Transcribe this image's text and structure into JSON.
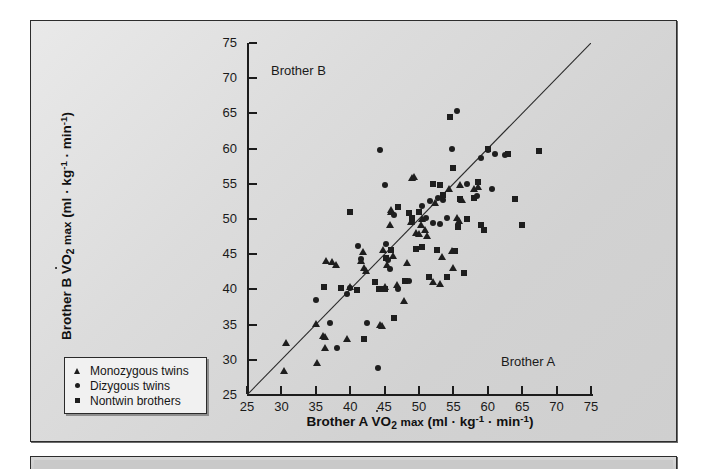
{
  "figure": {
    "annotation_brother_b": "Brother B",
    "annotation_brother_a": "Brother A"
  },
  "legend": {
    "items": [
      {
        "marker": "triangle-marker",
        "label": "Monozygous twins"
      },
      {
        "marker": "circle-marker",
        "label": "Dizygous twins"
      },
      {
        "marker": "square-marker",
        "label": "Nontwin brothers"
      }
    ]
  },
  "chart_data": {
    "type": "scatter",
    "title": "",
    "xlabel": "Brother A VO2 max (ml · kg-1 · min-1)",
    "ylabel": "Brother B VO2 max (ml · kg-1 · min-1)",
    "xlim": [
      25,
      75
    ],
    "ylim": [
      25,
      75
    ],
    "xticks": [
      25,
      30,
      35,
      40,
      45,
      50,
      55,
      60,
      65,
      70,
      75
    ],
    "yticks": [
      25,
      30,
      35,
      40,
      45,
      50,
      55,
      60,
      65,
      70,
      75
    ],
    "grid": false,
    "legend_position": "lower-left-outside",
    "reference_line": {
      "label": "line of identity",
      "from": [
        25,
        25
      ],
      "to": [
        75,
        75
      ]
    },
    "series": [
      {
        "name": "Monozygous twins",
        "marker": "triangle",
        "points": [
          [
            30.4,
            28.4
          ],
          [
            30.6,
            32.4
          ],
          [
            35.0,
            35.1
          ],
          [
            35.2,
            29.5
          ],
          [
            36.0,
            33.4
          ],
          [
            36.3,
            33.3
          ],
          [
            36.4,
            31.7
          ],
          [
            36.5,
            44.0
          ],
          [
            37.3,
            43.9
          ],
          [
            38.0,
            43.4
          ],
          [
            39.5,
            32.9
          ],
          [
            40.0,
            40.3
          ],
          [
            41.6,
            44.0
          ],
          [
            41.9,
            45.3
          ],
          [
            42.0,
            43.0
          ],
          [
            42.3,
            42.6
          ],
          [
            44.3,
            34.9
          ],
          [
            44.6,
            34.8
          ],
          [
            44.8,
            45.6
          ],
          [
            45.0,
            40.4
          ],
          [
            45.3,
            43.5
          ],
          [
            45.8,
            49.2
          ],
          [
            45.9,
            51.0
          ],
          [
            46.0,
            51.3
          ],
          [
            46.2,
            44.7
          ],
          [
            46.8,
            40.6
          ],
          [
            47.8,
            38.4
          ],
          [
            48.3,
            43.7
          ],
          [
            48.8,
            49.6
          ],
          [
            49.0,
            55.8
          ],
          [
            49.3,
            56.0
          ],
          [
            49.6,
            48.0
          ],
          [
            50.0,
            47.8
          ],
          [
            50.3,
            49.2
          ],
          [
            50.5,
            50.0
          ],
          [
            50.8,
            48.4
          ],
          [
            51.2,
            47.6
          ],
          [
            52.0,
            41.0
          ],
          [
            52.3,
            52.3
          ],
          [
            53.0,
            40.8
          ],
          [
            53.4,
            44.6
          ],
          [
            54.4,
            54.2
          ],
          [
            54.8,
            45.4
          ],
          [
            55.0,
            43.0
          ],
          [
            55.5,
            50.1
          ],
          [
            55.8,
            49.7
          ],
          [
            56.0,
            54.8
          ],
          [
            56.3,
            52.7
          ],
          [
            58.0,
            54.3
          ],
          [
            58.6,
            54.6
          ]
        ]
      },
      {
        "name": "Dizygous twins",
        "marker": "circle",
        "points": [
          [
            35.0,
            38.5
          ],
          [
            37.0,
            35.2
          ],
          [
            38.1,
            31.7
          ],
          [
            39.6,
            39.4
          ],
          [
            40.0,
            40.2
          ],
          [
            41.2,
            46.2
          ],
          [
            41.6,
            44.3
          ],
          [
            42.5,
            35.2
          ],
          [
            44.0,
            28.8
          ],
          [
            44.4,
            59.8
          ],
          [
            45.0,
            54.8
          ],
          [
            45.2,
            46.5
          ],
          [
            45.5,
            44.2
          ],
          [
            45.8,
            42.9
          ],
          [
            46.3,
            50.6
          ],
          [
            47.0,
            40.0
          ],
          [
            48.5,
            41.2
          ],
          [
            49.0,
            49.6
          ],
          [
            50.5,
            51.8
          ],
          [
            51.0,
            50.1
          ],
          [
            51.6,
            52.5
          ],
          [
            52.0,
            49.5
          ],
          [
            52.8,
            53.0
          ],
          [
            53.0,
            49.3
          ],
          [
            53.5,
            52.7
          ],
          [
            54.0,
            50.2
          ],
          [
            54.8,
            60.0
          ],
          [
            55.5,
            65.4
          ],
          [
            56.0,
            52.8
          ],
          [
            57.0,
            55.0
          ],
          [
            58.5,
            53.2
          ],
          [
            59.0,
            58.6
          ],
          [
            60.0,
            59.8
          ],
          [
            60.6,
            54.2
          ],
          [
            61.0,
            59.2
          ],
          [
            62.5,
            59.1
          ]
        ]
      },
      {
        "name": "Nontwin brothers",
        "marker": "square",
        "points": [
          [
            36.2,
            40.3
          ],
          [
            38.6,
            40.2
          ],
          [
            40.0,
            51.0
          ],
          [
            41.0,
            39.9
          ],
          [
            42.0,
            33.0
          ],
          [
            43.6,
            41.0
          ],
          [
            44.2,
            40.0
          ],
          [
            45.0,
            40.0
          ],
          [
            45.2,
            44.5
          ],
          [
            46.0,
            45.6
          ],
          [
            46.4,
            36.0
          ],
          [
            47.0,
            51.7
          ],
          [
            48.0,
            41.2
          ],
          [
            48.6,
            50.8
          ],
          [
            49.0,
            50.2
          ],
          [
            49.5,
            45.8
          ],
          [
            50.0,
            51.0
          ],
          [
            50.5,
            46.0
          ],
          [
            51.5,
            41.7
          ],
          [
            52.0,
            55.0
          ],
          [
            52.6,
            45.6
          ],
          [
            53.0,
            54.8
          ],
          [
            53.5,
            53.4
          ],
          [
            54.0,
            41.8
          ],
          [
            54.5,
            64.5
          ],
          [
            55.0,
            57.3
          ],
          [
            55.3,
            45.5
          ],
          [
            55.6,
            48.8
          ],
          [
            56.0,
            52.8
          ],
          [
            56.5,
            42.3
          ],
          [
            57.0,
            50.0
          ],
          [
            58.0,
            53.0
          ],
          [
            58.6,
            55.2
          ],
          [
            59.0,
            49.1
          ],
          [
            59.5,
            48.4
          ],
          [
            60.0,
            59.9
          ],
          [
            63.0,
            59.2
          ],
          [
            64.0,
            52.8
          ],
          [
            65.0,
            49.2
          ],
          [
            67.5,
            59.6
          ]
        ]
      }
    ]
  }
}
